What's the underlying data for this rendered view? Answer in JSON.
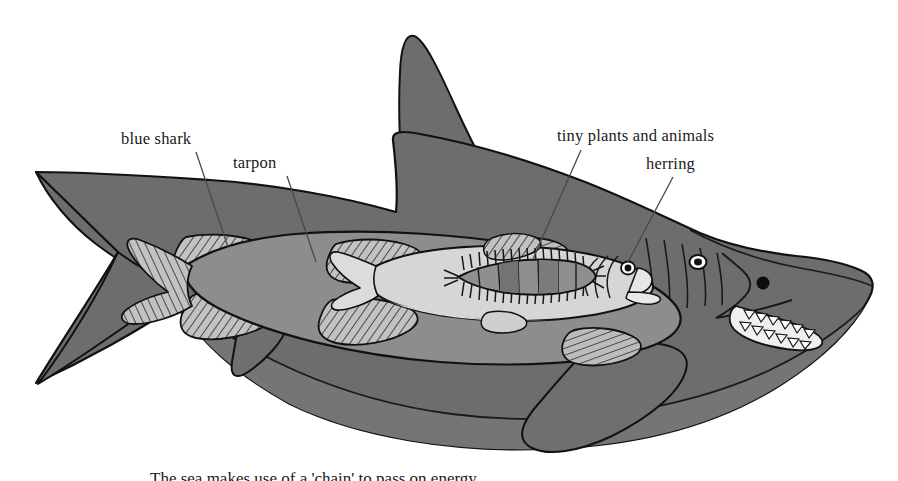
{
  "figure": {
    "background_color": "#ffffff",
    "width": 898,
    "height": 481
  },
  "labels": [
    {
      "id": "blue-shark",
      "text": "blue shark",
      "leader_from": [
        196,
        152
      ],
      "leader_to": [
        228,
        245
      ]
    },
    {
      "id": "tarpon",
      "text": "tarpon",
      "leader_from": [
        287,
        176
      ],
      "leader_to": [
        316,
        260
      ]
    },
    {
      "id": "tiny-plants-and-animals",
      "text": "tiny plants and animals",
      "leader_from": [
        580,
        150
      ],
      "leader_to": [
        533,
        258
      ]
    },
    {
      "id": "herring",
      "text": "herring",
      "leader_from": [
        672,
        177
      ],
      "leader_to": [
        627,
        261
      ]
    }
  ],
  "caption": {
    "text": "The sea makes use of a 'chain' to pass on energy.",
    "note": "cropped at image bottom edge"
  },
  "organisms": [
    {
      "name": "blue shark",
      "role": "outer predator",
      "fill_color": "#6d6d6d",
      "features": [
        "dorsal-fin",
        "heterocercal-tail",
        "pectoral-fin",
        "pelvic-fin",
        "gill-slits",
        "eye",
        "nostril",
        "teeth"
      ]
    },
    {
      "name": "tarpon",
      "role": "mid predator inside shark",
      "fill_color": "#8d8d8d",
      "features": [
        "striped-dorsal-fin",
        "striped-anal-fin",
        "striped-pectoral-fin",
        "forked-tail"
      ]
    },
    {
      "name": "herring",
      "role": "small fish inside tarpon",
      "fill_color": "#d6d6d6",
      "features": [
        "eye",
        "gill-arcs",
        "mouth",
        "dorsal-fin",
        "pelvic-fin",
        "tail-fin",
        "stomach"
      ]
    },
    {
      "name": "tiny plants and animals",
      "role": "plankton inside herring stomach",
      "fill_color": "#8a8a8a",
      "features": [
        "bristled-lens-shape",
        "segmented-cells"
      ]
    }
  ],
  "colors": {
    "shark_body": "#6d6d6d",
    "shark_belly": "#767676",
    "tarpon_body": "#8d8d8d",
    "tarpon_fin": "#b0b0b0",
    "herring_body": "#d6d6d6",
    "herring_belly": "#e2e2e2",
    "plankton": "#909090",
    "outline": "#1a1a1a",
    "leader_line": "#555555",
    "text": "#1a1a1a",
    "background": "#ffffff"
  }
}
